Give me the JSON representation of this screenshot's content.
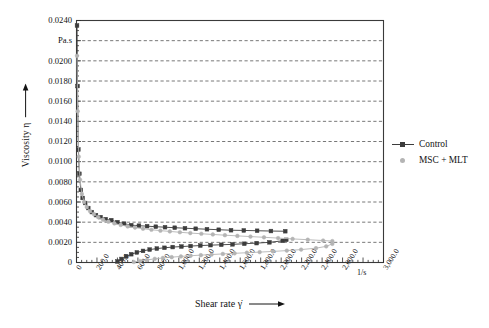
{
  "chart_data": {
    "type": "line",
    "title": "",
    "xlabel": "Shear rate γ̇",
    "ylabel": "Viscosity η",
    "x_unit": "1/s",
    "y_unit": "Pa.s",
    "xlim": [
      0,
      3000
    ],
    "ylim": [
      0,
      0.024
    ],
    "grid": "horizontal-dashed",
    "legend_position": "right-outside",
    "x_ticklabels": [
      "0",
      "200.0",
      "400.0",
      "600.0",
      "800.0",
      "1,000.0",
      "1,200.0",
      "1,400.0",
      "1,600.0",
      "1,800.0",
      "2,000.0",
      "2,200.0",
      "2,400.0",
      "2,600.0",
      "3,000.0"
    ],
    "x_tickvalues": [
      0,
      200,
      400,
      600,
      800,
      1000,
      1200,
      1400,
      1600,
      1800,
      2000,
      2200,
      2400,
      2600,
      3000
    ],
    "y_ticklabels": [
      "0.0240",
      "Pa.s",
      "0.0200",
      "0.0180",
      "0.0160",
      "0.0140",
      "0.0120",
      "0.0100",
      "0.0080",
      "0.0060",
      "0.0040",
      "0.0020",
      "0"
    ],
    "y_tickvalues": [
      0.024,
      0.022,
      0.02,
      0.018,
      0.016,
      0.014,
      0.012,
      0.01,
      0.008,
      0.006,
      0.004,
      0.002,
      0
    ],
    "series": [
      {
        "name": "Control",
        "branch": "down",
        "color": "#3c3c3c",
        "marker": "filled-square",
        "x": [
          5,
          10,
          18,
          28,
          42,
          60,
          85,
          115,
          150,
          190,
          235,
          285,
          340,
          400,
          465,
          535,
          610,
          690,
          775,
          865,
          960,
          1060,
          1165,
          1275,
          1390,
          1510,
          1635,
          1765,
          1900,
          2040
        ],
        "y": [
          0.0235,
          0.0175,
          0.0112,
          0.0088,
          0.0072,
          0.0064,
          0.0059,
          0.0054,
          0.005,
          0.0047,
          0.0045,
          0.0043,
          0.0042,
          0.004,
          0.00385,
          0.0037,
          0.00365,
          0.0036,
          0.00355,
          0.0035,
          0.00345,
          0.0034,
          0.00335,
          0.0033,
          0.00325,
          0.0032,
          0.00318,
          0.00315,
          0.00312,
          0.0031
        ]
      },
      {
        "name": "Control",
        "branch": "up",
        "color": "#3c3c3c",
        "marker": "filled-square",
        "x": [
          400,
          440,
          485,
          535,
          590,
          650,
          715,
          785,
          860,
          940,
          1025,
          1115,
          1210,
          1310,
          1415,
          1525,
          1640,
          1760,
          1885,
          2015,
          2050
        ],
        "y": [
          0.0001,
          0.00035,
          0.0006,
          0.00082,
          0.001,
          0.00115,
          0.00128,
          0.00138,
          0.00146,
          0.00153,
          0.00158,
          0.00163,
          0.00168,
          0.00172,
          0.00176,
          0.0018,
          0.00186,
          0.00192,
          0.002,
          0.00215,
          0.00225
        ]
      },
      {
        "name": "MSC + MLT",
        "branch": "down",
        "color": "#b4b4b4",
        "marker": "filled-circle",
        "x": [
          5,
          12,
          22,
          35,
          52,
          74,
          100,
          132,
          170,
          212,
          260,
          312,
          370,
          432,
          500,
          572,
          650,
          732,
          820,
          912,
          1010,
          1112,
          1220,
          1332,
          1450,
          1572,
          1700,
          1832,
          1970,
          2112,
          2260,
          2410,
          2500
        ],
        "y": [
          0.0205,
          0.015,
          0.0105,
          0.0082,
          0.0068,
          0.006,
          0.0055,
          0.0051,
          0.0048,
          0.0045,
          0.00425,
          0.00405,
          0.00388,
          0.00372,
          0.00358,
          0.00346,
          0.00335,
          0.00325,
          0.00316,
          0.00308,
          0.003,
          0.00292,
          0.00285,
          0.00278,
          0.00271,
          0.00264,
          0.00257,
          0.0025,
          0.00242,
          0.00234,
          0.00226,
          0.00218,
          0.00212
        ]
      },
      {
        "name": "MSC + MLT",
        "branch": "up",
        "color": "#b4b4b4",
        "marker": "filled-circle",
        "x": [
          560,
          620,
          690,
          765,
          845,
          930,
          1020,
          1115,
          1215,
          1320,
          1430,
          1545,
          1665,
          1790,
          1920,
          2055,
          2195,
          2340,
          2440,
          2500
        ],
        "y": [
          5e-05,
          0.00015,
          0.00026,
          0.00036,
          0.00045,
          0.00053,
          0.0006,
          0.00067,
          0.00073,
          0.00079,
          0.00085,
          0.00091,
          0.00097,
          0.00103,
          0.0011,
          0.00118,
          0.00128,
          0.00142,
          0.0016,
          0.00185
        ]
      }
    ],
    "legend": [
      {
        "label": "Control",
        "color": "#3c3c3c",
        "marker": "filled-square",
        "has_line": true
      },
      {
        "label": "MSC + MLT",
        "color": "#b4b4b4",
        "marker": "filled-circle",
        "has_line": false
      }
    ]
  },
  "axis": {
    "y_title": "Viscosity η",
    "x_title": "Shear rate γ̇"
  }
}
